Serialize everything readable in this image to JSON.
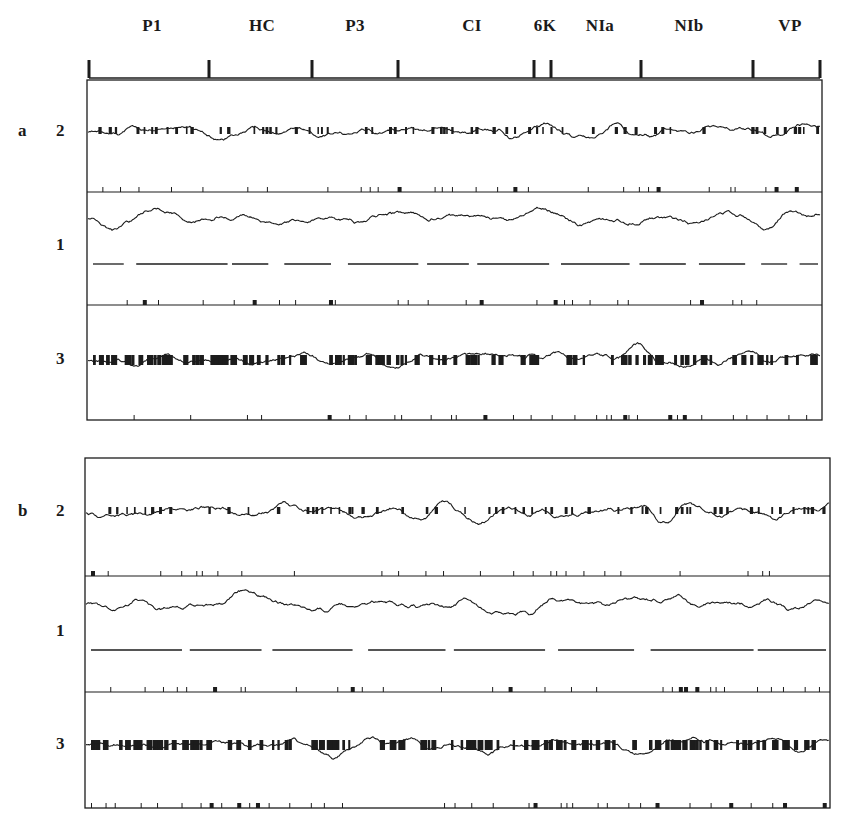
{
  "figure": {
    "genome_map": {
      "regions": [
        {
          "label": "P1",
          "x": 152
        },
        {
          "label": "HC",
          "x": 262
        },
        {
          "label": "P3",
          "x": 355
        },
        {
          "label": "CI",
          "x": 472
        },
        {
          "label": "6K",
          "x": 545
        },
        {
          "label": "NIa",
          "x": 600
        },
        {
          "label": "NIb",
          "x": 689
        },
        {
          "label": "VP",
          "x": 790
        }
      ],
      "boundary_ticks_x": [
        89,
        209,
        312,
        398,
        534,
        551,
        641,
        753,
        820
      ],
      "line_y": 78
    },
    "panels": [
      {
        "letter": "a",
        "box": {
          "x": 87,
          "y": 80,
          "w": 735,
          "h": 340
        },
        "rows": [
          {
            "num": "2",
            "top": 80,
            "bottom": 192,
            "baseline": 132,
            "seed": 11,
            "amp": 48,
            "style": "dashes"
          },
          {
            "num": "1",
            "top": 192,
            "bottom": 305,
            "baseline": 246,
            "seed": 23,
            "amp": 52,
            "style": "line"
          },
          {
            "num": "3",
            "top": 305,
            "bottom": 420,
            "baseline": 360,
            "seed": 37,
            "amp": 52,
            "style": "blocks"
          }
        ]
      },
      {
        "letter": "b",
        "box": {
          "x": 85,
          "y": 458,
          "w": 745,
          "h": 350
        },
        "rows": [
          {
            "num": "2",
            "top": 458,
            "bottom": 576,
            "baseline": 512,
            "seed": 51,
            "amp": 50,
            "style": "dashes"
          },
          {
            "num": "1",
            "top": 576,
            "bottom": 692,
            "baseline": 632,
            "seed": 67,
            "amp": 52,
            "style": "line"
          },
          {
            "num": "3",
            "top": 692,
            "bottom": 808,
            "baseline": 745,
            "seed": 83,
            "amp": 52,
            "style": "blocks"
          }
        ]
      }
    ],
    "colors": {
      "ink": "#1c1c1c",
      "paper": "#ffffff",
      "bleed": "#d9d9d9"
    }
  },
  "chart_data": {
    "type": "line",
    "title": "",
    "panels": [
      "a",
      "b"
    ],
    "series": [
      {
        "name": "2",
        "description": "profile trace row 2 with dashed reference"
      },
      {
        "name": "1",
        "description": "profile trace row 1 with baseline line"
      },
      {
        "name": "3",
        "description": "profile trace row 3 with block reference"
      }
    ],
    "categories": [
      "P1",
      "HC",
      "P3",
      "CI",
      "6K",
      "NIa",
      "NIb",
      "VP"
    ],
    "xlabel": "",
    "ylabel": ""
  }
}
